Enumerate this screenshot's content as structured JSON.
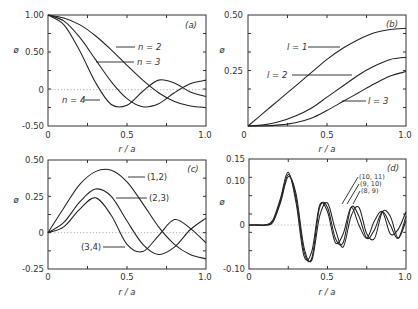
{
  "chart_data": [
    {
      "type": "line",
      "panel_label": "(a)",
      "xlabel": "r / a",
      "ylabel": "ø",
      "xlim": [
        0,
        1.0
      ],
      "ylim": [
        -0.5,
        1.0
      ],
      "xticks": [
        "0",
        "0.5",
        "1.0"
      ],
      "yticks": [
        "1.00",
        "0.50",
        "0",
        "-0.50"
      ],
      "x": [
        0,
        0.1,
        0.2,
        0.3,
        0.4,
        0.5,
        0.6,
        0.7,
        0.8,
        0.9,
        1.0
      ],
      "series": [
        {
          "name": "n = 2",
          "values": [
            1.0,
            0.96,
            0.87,
            0.72,
            0.53,
            0.32,
            0.12,
            -0.05,
            -0.17,
            -0.23,
            -0.25
          ]
        },
        {
          "name": "n = 3",
          "values": [
            1.0,
            0.92,
            0.7,
            0.4,
            0.1,
            -0.13,
            -0.24,
            -0.2,
            -0.05,
            0.07,
            0.12
          ]
        },
        {
          "name": "n = 4",
          "values": [
            1.0,
            0.87,
            0.52,
            0.09,
            -0.21,
            -0.22,
            -0.03,
            0.12,
            0.08,
            -0.04,
            -0.1
          ]
        }
      ],
      "annotations": [
        "n = 2",
        "n = 3",
        "n = 4",
        "(a)"
      ]
    },
    {
      "type": "line",
      "panel_label": "(b)",
      "xlabel": "r / a",
      "ylabel": "ø",
      "xlim": [
        0,
        1.0
      ],
      "ylim": [
        0,
        0.5
      ],
      "xticks": [
        "0",
        "0.5",
        "1.0"
      ],
      "yticks": [
        "0.50",
        "0.25"
      ],
      "x": [
        0,
        0.1,
        0.2,
        0.3,
        0.4,
        0.5,
        0.6,
        0.7,
        0.8,
        0.9,
        1.0
      ],
      "series": [
        {
          "name": "l = 1",
          "values": [
            0.0,
            0.06,
            0.12,
            0.18,
            0.24,
            0.3,
            0.35,
            0.39,
            0.42,
            0.435,
            0.44
          ]
        },
        {
          "name": "l = 2",
          "values": [
            0.0,
            0.005,
            0.02,
            0.045,
            0.08,
            0.13,
            0.18,
            0.23,
            0.27,
            0.3,
            0.31
          ]
        },
        {
          "name": "l = 3",
          "values": [
            0.0,
            0.0,
            0.005,
            0.015,
            0.035,
            0.07,
            0.11,
            0.15,
            0.19,
            0.225,
            0.245
          ]
        }
      ],
      "annotations": [
        "l = 1",
        "l = 2",
        "l = 3",
        "(b)"
      ]
    },
    {
      "type": "line",
      "panel_label": "(c)",
      "xlabel": "r / a",
      "ylabel": "ø",
      "xlim": [
        0,
        1.0
      ],
      "ylim": [
        -0.25,
        0.5
      ],
      "xticks": [
        "0",
        "0.5",
        "1.0"
      ],
      "yticks": [
        "0.50",
        "0.25",
        "0",
        "-0.25"
      ],
      "x": [
        0,
        0.1,
        0.2,
        0.3,
        0.4,
        0.5,
        0.6,
        0.7,
        0.8,
        0.9,
        1.0
      ],
      "series": [
        {
          "name": "(1,2)",
          "values": [
            0.0,
            0.17,
            0.33,
            0.42,
            0.43,
            0.35,
            0.2,
            0.04,
            -0.08,
            -0.15,
            -0.18
          ]
        },
        {
          "name": "(2,3)",
          "values": [
            0.0,
            0.07,
            0.21,
            0.3,
            0.25,
            0.08,
            -0.08,
            -0.15,
            -0.1,
            0.02,
            0.1
          ]
        },
        {
          "name": "(3,4)",
          "values": [
            0.0,
            0.04,
            0.16,
            0.24,
            0.12,
            -0.08,
            -0.13,
            -0.02,
            0.09,
            0.03,
            -0.07
          ]
        }
      ],
      "annotations": [
        "(1,2)",
        "(2,3)",
        "(3,4)",
        "(c)"
      ]
    },
    {
      "type": "line",
      "panel_label": "(d)",
      "xlabel": "r / a",
      "ylabel": "ø",
      "xlim": [
        0,
        1.0
      ],
      "ylim": [
        -0.1,
        0.15
      ],
      "xticks": [
        "0",
        "0.5",
        "1.0"
      ],
      "yticks": [
        "0.15",
        "0.10",
        "0",
        "-0.10"
      ],
      "x": [
        0,
        0.05,
        0.1,
        0.15,
        0.2,
        0.25,
        0.3,
        0.35,
        0.4,
        0.45,
        0.5,
        0.55,
        0.6,
        0.65,
        0.7,
        0.75,
        0.8,
        0.85,
        0.9,
        0.95,
        1.0
      ],
      "series": [
        {
          "name": "(8, 9)",
          "values": [
            0,
            0,
            0,
            0.005,
            0.05,
            0.11,
            0.07,
            -0.05,
            -0.08,
            0.02,
            0.05,
            -0.01,
            -0.05,
            0.02,
            0.04,
            -0.02,
            -0.03,
            0.03,
            0.02,
            -0.03,
            0.01
          ]
        },
        {
          "name": "(9, 10)",
          "values": [
            0,
            0,
            0,
            0.007,
            0.055,
            0.115,
            0.06,
            -0.06,
            -0.075,
            0.04,
            0.04,
            -0.03,
            -0.04,
            0.04,
            0.02,
            -0.03,
            -0.01,
            0.03,
            0.0,
            -0.03,
            0.02
          ]
        },
        {
          "name": "(10, 11)",
          "values": [
            0,
            0,
            0,
            0.01,
            0.06,
            0.12,
            0.05,
            -0.07,
            -0.06,
            0.045,
            0.03,
            -0.04,
            -0.02,
            0.04,
            0.0,
            -0.03,
            0.01,
            0.03,
            -0.02,
            -0.01,
            0.03
          ]
        }
      ],
      "annotations": [
        "(10, 11)",
        "(9, 10)",
        "(8, 9)",
        "(d)"
      ]
    }
  ],
  "panels": [
    {
      "id": "a",
      "label": "(a)",
      "xlabel": "r / a",
      "ylabel": "ø"
    },
    {
      "id": "b",
      "label": "(b)",
      "xlabel": "r / a",
      "ylabel": "ø"
    },
    {
      "id": "c",
      "label": "(c)",
      "xlabel": "r / a",
      "ylabel": "ø"
    },
    {
      "id": "d",
      "label": "(d)",
      "xlabel": "r / a",
      "ylabel": "ø"
    }
  ]
}
